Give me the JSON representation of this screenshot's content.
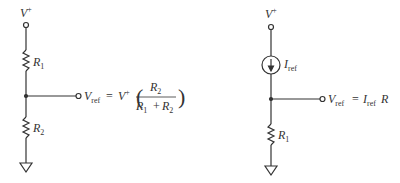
{
  "circuits": [
    {
      "name": "resistive-divider",
      "supply": {
        "label": "V",
        "sup": "+"
      },
      "resistor_top": {
        "label": "R",
        "sub": "1"
      },
      "resistor_bottom": {
        "label": "R",
        "sub": "2"
      },
      "output": {
        "label": "V",
        "label_sub": "ref",
        "equals": "=",
        "rhs_v": "V",
        "rhs_sup": "+",
        "paren_open": "(",
        "paren_close": ")",
        "num": "R",
        "num_sub": "2",
        "den_a": "R",
        "den_a_sub": "1",
        "den_plus": "+",
        "den_b": "R",
        "den_b_sub": "2"
      }
    },
    {
      "name": "current-source-reference",
      "supply": {
        "label": "V",
        "sup": "+"
      },
      "source": {
        "label": "I",
        "sub": "ref"
      },
      "resistor": {
        "label": "R",
        "sub": "1"
      },
      "output": {
        "label": "V",
        "label_sub": "ref",
        "equals": "=",
        "rhs_i": "I",
        "rhs_i_sub": "ref",
        "rhs_r": "R"
      }
    }
  ]
}
